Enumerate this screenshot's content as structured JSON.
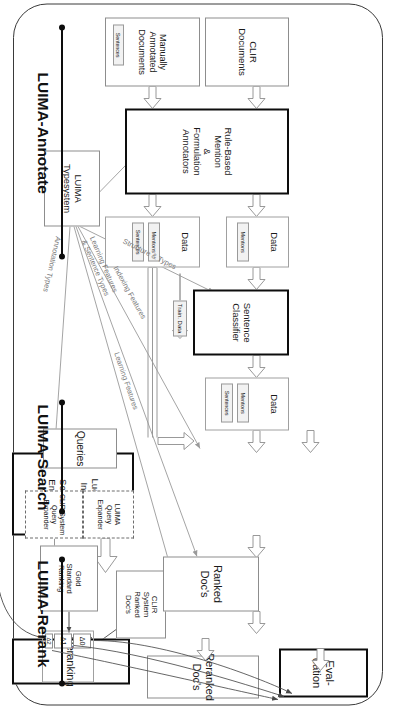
{
  "figure": {
    "orientation": "rotated-90"
  },
  "sections": [
    {
      "id": "annotate",
      "label": "LUIMA-Annotate"
    },
    {
      "id": "search",
      "label": "LUIMA-Search"
    },
    {
      "id": "rerank",
      "label": "LUIMA-Rerank"
    }
  ],
  "nodes": {
    "evaluation": {
      "label": "Eval-\nuation",
      "line1": "Eval-",
      "line2": "uation"
    },
    "reranked_docs": {
      "line1": "Reranked",
      "line2": "Doc's"
    },
    "reranking": {
      "line1": "Reranking"
    },
    "ranked_docs": {
      "line1": "Ranked",
      "line2": "Doc's"
    },
    "lucene": {
      "line1": "Lucene",
      "line2": "Index",
      "line3": "&",
      "line4": "Search",
      "line5": "Engine"
    },
    "gold_standard": {
      "line1": "Gold",
      "line2": "Standard",
      "line3": "Ranking"
    },
    "clir_ranked": {
      "line1": "CLIR",
      "line2": "System",
      "line3": "Ranked",
      "line4": "Doc's"
    },
    "clir_expander": {
      "line1": "CLIR System",
      "line2": "Query",
      "line3": "Expander"
    },
    "luima_expander": {
      "line1": "LUIMA",
      "line2": "Query",
      "line3": "Expander"
    },
    "queries": {
      "line1": "Queries"
    },
    "luima_typesystem": {
      "line1": "LUIMA",
      "line2": "Typesystem"
    },
    "sentence_classifier": {
      "line1": "Sentence",
      "line2": "Classifier"
    },
    "rule_based": {
      "line1": "Rule-Based",
      "line2": "Mention",
      "line3": "&",
      "line4": "Formulation",
      "line5": "Annotators"
    },
    "clir_documents": {
      "line1": "CLIR",
      "line2": "Documents"
    },
    "manual_documents": {
      "line1": "Manually",
      "line2": "Annotated",
      "line3": "Documents"
    },
    "data_top": {
      "label": "Data"
    },
    "data_mid": {
      "label": "Data"
    },
    "data_bottom": {
      "label": "Data"
    },
    "train_data": {
      "label": "Train. Data"
    }
  },
  "deltas": [
    {
      "label": "Δ0"
    },
    {
      "label": "Δ1"
    },
    {
      "label": "Δ2"
    }
  ],
  "tags": {
    "mentions": "Mentions",
    "sentences": "Sentences"
  },
  "arrow_labels": [
    {
      "id": "structure-types",
      "text": "Structure & Types"
    },
    {
      "id": "indexing-features",
      "text": "Indexing Features"
    },
    {
      "id": "learning-features",
      "text": "Learning Features"
    },
    {
      "id": "learning-sentence",
      "line1": "Learning Features",
      "line2": "& Sentence Types"
    },
    {
      "id": "annotation-types",
      "text": "Annotation Types"
    }
  ],
  "colors": {
    "stroke_bold": "#0d0d0d",
    "stroke_thin": "#8d8d8d",
    "stroke_dashed": "#6d6d6d",
    "label_gray": "#7a7a7a",
    "tag_fill": "#f2f2f2",
    "background": "#ffffff"
  }
}
